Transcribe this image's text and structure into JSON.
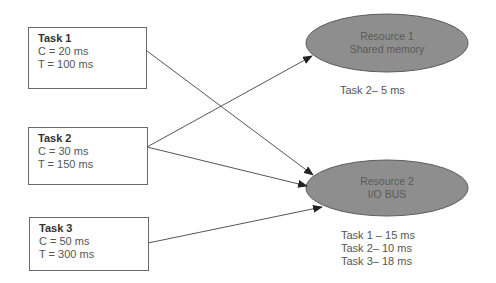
{
  "tasks": [
    {
      "title": "Task 1",
      "c": "C = 20 ms",
      "t": "T = 100 ms"
    },
    {
      "title": "Task 2",
      "c": "C = 30 ms",
      "t": "T = 150 ms"
    },
    {
      "title": "Task 3",
      "c": "C = 50 ms",
      "t": "T = 300 ms"
    }
  ],
  "resources": [
    {
      "line1": "Resource 1",
      "line2": "Shared memory",
      "usage": [
        "Task 2– 5 ms"
      ]
    },
    {
      "line1": "Resource 2",
      "line2": "I/O BUS",
      "usage": [
        "Task 1 – 15 ms",
        "Task 2– 10 ms",
        "Task 3– 18 ms"
      ]
    }
  ],
  "edges": [
    {
      "from": "Task 1",
      "to": "Resource 2"
    },
    {
      "from": "Task 2",
      "to": "Resource 1"
    },
    {
      "from": "Task 2",
      "to": "Resource 2"
    },
    {
      "from": "Task 3",
      "to": "Resource 2"
    }
  ],
  "colors": {
    "ellipse_fill": "#8e8e8e",
    "ellipse_stroke": "#5c5c5c",
    "arrow": "#555555"
  }
}
